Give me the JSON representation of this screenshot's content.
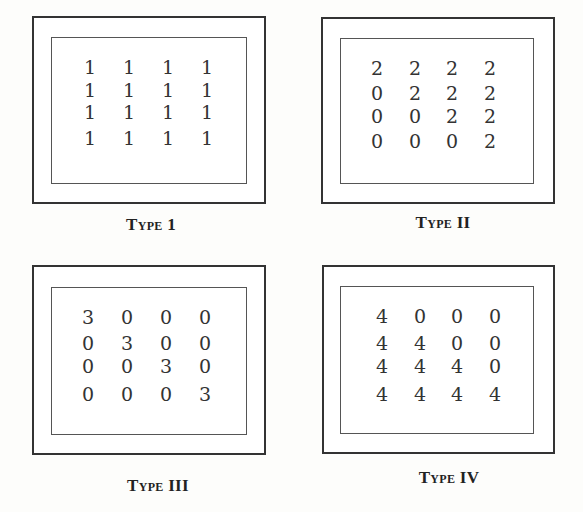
{
  "figure": {
    "panels": [
      {
        "label": "Type 1",
        "matrix": [
          [
            1,
            1,
            1,
            1
          ],
          [
            1,
            1,
            1,
            1
          ],
          [
            1,
            1,
            1,
            1
          ],
          [
            1,
            1,
            1,
            1
          ]
        ]
      },
      {
        "label": "Type II",
        "matrix": [
          [
            2,
            2,
            2,
            2
          ],
          [
            0,
            2,
            2,
            2
          ],
          [
            0,
            0,
            2,
            2
          ],
          [
            0,
            0,
            0,
            2
          ]
        ]
      },
      {
        "label": "Type III",
        "matrix": [
          [
            3,
            0,
            0,
            0
          ],
          [
            0,
            3,
            0,
            0
          ],
          [
            0,
            0,
            3,
            0
          ],
          [
            0,
            0,
            0,
            3
          ]
        ]
      },
      {
        "label": "Type IV",
        "matrix": [
          [
            4,
            0,
            0,
            0
          ],
          [
            4,
            4,
            0,
            0
          ],
          [
            4,
            4,
            4,
            0
          ],
          [
            4,
            4,
            4,
            4
          ]
        ]
      }
    ]
  }
}
